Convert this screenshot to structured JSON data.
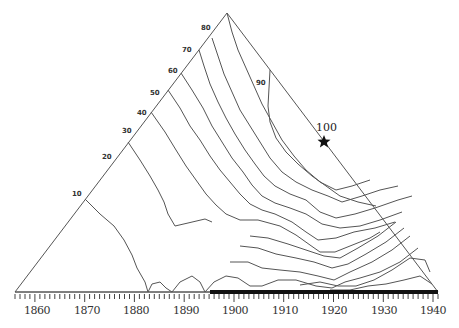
{
  "diagram": {
    "type": "ternary-contour",
    "triangle": {
      "apex": [
        227,
        13
      ],
      "base_left": [
        15,
        292
      ],
      "base_right": [
        438,
        292
      ]
    },
    "edge_labels": [
      {
        "label": "10",
        "pos": 0.1
      },
      {
        "label": "20",
        "pos": 0.2
      },
      {
        "label": "30",
        "pos": 0.3
      },
      {
        "label": "40",
        "pos": 0.4
      },
      {
        "label": "50",
        "pos": 0.5
      },
      {
        "label": "60",
        "pos": 0.6
      },
      {
        "label": "70",
        "pos": 0.7
      },
      {
        "label": "80",
        "pos": 0.8
      }
    ],
    "inner_label": "90",
    "star": {
      "label": "100",
      "symbol": "star",
      "x": 324,
      "y": 141
    },
    "year_axis": {
      "labels": [
        "1860",
        "1870",
        "1880",
        "1890",
        "1900",
        "1910",
        "1920",
        "1930",
        "1940"
      ],
      "start_year": 1856,
      "end_year": 1941,
      "highlight_from_year": 1895,
      "highlight_color": "#111111"
    },
    "line_color": "#555555"
  }
}
